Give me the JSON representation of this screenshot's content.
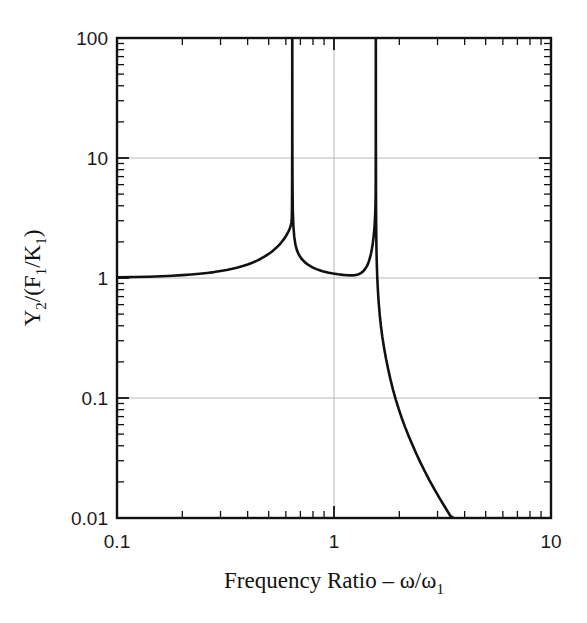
{
  "chart_data": {
    "type": "line",
    "title": "",
    "xlabel": "Frequency Ratio – ω/ω₁",
    "xlabel_parts": {
      "main": "Frequency Ratio – ω/ω",
      "sub": "1"
    },
    "ylabel": "Y₂/(F₁/K₁)",
    "ylabel_parts": {
      "p1": "Y",
      "p1sub": "2",
      "p2": "/(F",
      "p2sub": "1",
      "p3": "/K",
      "p3sub": "1",
      "p4": ")"
    },
    "xscale": "log",
    "yscale": "log",
    "xlim": [
      0.1,
      10
    ],
    "ylim": [
      0.01,
      100
    ],
    "xticks": [
      0.1,
      1,
      10
    ],
    "xtick_labels": [
      "0.1",
      "1",
      "10"
    ],
    "yticks": [
      0.01,
      0.1,
      1,
      10,
      100
    ],
    "ytick_labels": [
      "0.01",
      "0.1",
      "1",
      "10",
      "100"
    ],
    "grid": true,
    "grid_color": "#b8b8b8",
    "legend": "none",
    "line_color": "#111111",
    "line_width": 2.6,
    "axis_color": "#111111",
    "background": "#ffffff",
    "annotations": [],
    "features": {
      "resonance_1": 0.642,
      "resonance_2": 1.558,
      "antiresonance_ratio": 1.18,
      "antiresonance_value": 1.05,
      "low_frequency_asymptote": 1.0,
      "secondary_peak_visible_value": 5.5
    },
    "series": [
      {
        "name": "Y2/(F1/K1)",
        "points": [
          [
            0.1,
            1.012
          ],
          [
            0.12,
            1.018
          ],
          [
            0.14,
            1.025
          ],
          [
            0.16,
            1.034
          ],
          [
            0.18,
            1.044
          ],
          [
            0.2,
            1.056
          ],
          [
            0.22,
            1.069
          ],
          [
            0.24,
            1.084
          ],
          [
            0.26,
            1.101
          ],
          [
            0.28,
            1.12
          ],
          [
            0.3,
            1.142
          ],
          [
            0.32,
            1.166
          ],
          [
            0.34,
            1.193
          ],
          [
            0.36,
            1.224
          ],
          [
            0.38,
            1.258
          ],
          [
            0.4,
            1.297
          ],
          [
            0.42,
            1.341
          ],
          [
            0.44,
            1.39
          ],
          [
            0.46,
            1.447
          ],
          [
            0.48,
            1.512
          ],
          [
            0.5,
            1.586
          ],
          [
            0.52,
            1.673
          ],
          [
            0.54,
            1.775
          ],
          [
            0.555,
            1.863
          ],
          [
            0.57,
            1.966
          ],
          [
            0.585,
            2.086
          ],
          [
            0.6,
            2.232
          ],
          [
            0.61,
            2.348
          ],
          [
            0.618,
            2.459
          ],
          [
            0.624,
            2.56
          ],
          [
            0.629,
            2.662
          ],
          [
            0.632,
            2.74
          ],
          [
            0.634,
            2.805
          ],
          [
            0.636,
            2.885
          ],
          [
            0.638,
            3.0
          ],
          [
            0.639,
            3.12
          ],
          [
            0.64,
            3.6
          ],
          [
            0.6405,
            4.2
          ],
          [
            0.641,
            5.4
          ],
          [
            0.6414,
            7.5
          ],
          [
            0.6417,
            11.0
          ],
          [
            0.6419,
            18.0
          ],
          [
            0.642,
            40.0
          ],
          [
            0.6421,
            100.0
          ],
          [
            0.6423,
            100.0
          ],
          [
            0.6425,
            40.0
          ],
          [
            0.6428,
            17.0
          ],
          [
            0.6432,
            10.0
          ],
          [
            0.6438,
            6.6
          ],
          [
            0.6446,
            4.8
          ],
          [
            0.646,
            3.6
          ],
          [
            0.65,
            2.7
          ],
          [
            0.656,
            2.2
          ],
          [
            0.664,
            1.9
          ],
          [
            0.675,
            1.7
          ],
          [
            0.69,
            1.555
          ],
          [
            0.71,
            1.44
          ],
          [
            0.735,
            1.35
          ],
          [
            0.765,
            1.278
          ],
          [
            0.8,
            1.22
          ],
          [
            0.84,
            1.175
          ],
          [
            0.885,
            1.14
          ],
          [
            0.935,
            1.112
          ],
          [
            0.99,
            1.09
          ],
          [
            1.045,
            1.074
          ],
          [
            1.1,
            1.062
          ],
          [
            1.15,
            1.055
          ],
          [
            1.2,
            1.052
          ],
          [
            1.25,
            1.057
          ],
          [
            1.29,
            1.07
          ],
          [
            1.33,
            1.098
          ],
          [
            1.365,
            1.14
          ],
          [
            1.395,
            1.196
          ],
          [
            1.42,
            1.262
          ],
          [
            1.445,
            1.36
          ],
          [
            1.465,
            1.475
          ],
          [
            1.482,
            1.61
          ],
          [
            1.497,
            1.77
          ],
          [
            1.51,
            1.96
          ],
          [
            1.521,
            2.18
          ],
          [
            1.53,
            2.42
          ],
          [
            1.537,
            2.68
          ],
          [
            1.543,
            2.98
          ],
          [
            1.548,
            3.38
          ],
          [
            1.551,
            3.75
          ],
          [
            1.5535,
            4.25
          ],
          [
            1.555,
            4.8
          ],
          [
            1.556,
            5.4
          ],
          [
            1.5568,
            6.6
          ],
          [
            1.5574,
            9.0
          ],
          [
            1.5578,
            14.0
          ],
          [
            1.558,
            30.0
          ],
          [
            1.5582,
            100.0
          ],
          [
            1.559,
            100.0
          ],
          [
            1.5596,
            30.0
          ],
          [
            1.56,
            14.0
          ],
          [
            1.5606,
            8.0
          ],
          [
            1.5615,
            5.2
          ],
          [
            1.563,
            3.5
          ],
          [
            1.5655,
            2.4
          ],
          [
            1.569,
            1.75
          ],
          [
            1.575,
            1.3
          ],
          [
            1.583,
            1.0
          ],
          [
            1.594,
            0.78
          ],
          [
            1.608,
            0.615
          ],
          [
            1.625,
            0.49
          ],
          [
            1.645,
            0.398
          ],
          [
            1.67,
            0.323
          ],
          [
            1.7,
            0.263
          ],
          [
            1.735,
            0.214
          ],
          [
            1.775,
            0.175
          ],
          [
            1.82,
            0.143
          ],
          [
            1.87,
            0.1175
          ],
          [
            1.925,
            0.0975
          ],
          [
            1.985,
            0.0815
          ],
          [
            2.05,
            0.0685
          ],
          [
            2.12,
            0.058
          ],
          [
            2.2,
            0.049
          ],
          [
            2.29,
            0.0413
          ],
          [
            2.39,
            0.0347
          ],
          [
            2.5,
            0.0291
          ],
          [
            2.62,
            0.0245
          ],
          [
            2.75,
            0.0207
          ],
          [
            2.9,
            0.0174
          ],
          [
            3.06,
            0.0147
          ],
          [
            3.24,
            0.0124
          ],
          [
            3.44,
            0.0104
          ],
          [
            3.56,
            0.01
          ]
        ]
      }
    ]
  },
  "axes": {
    "x_minor_ticks_label": "x-minor-ticks",
    "y_minor_ticks_label": "y-minor-ticks"
  }
}
